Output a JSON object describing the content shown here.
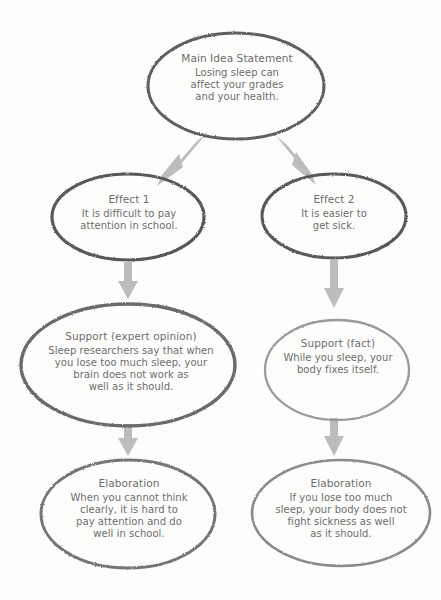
{
  "diagram": {
    "kind": "cause-and-effect-flowchart",
    "background_color": "#fdfdfc",
    "text_color": "#6d6d6d",
    "arrow_color": "#b9b9b9",
    "stroke_color_dark": "#616161",
    "stroke_color_light": "#8e8e8e",
    "nodes": {
      "main_idea": {
        "heading": "Main Idea Statement",
        "body_lines": [
          "Losing sleep can",
          "affect your grades",
          "and your health."
        ],
        "body_text": "Losing sleep can affect your grades and your health."
      },
      "effect_1": {
        "heading": "Effect 1",
        "body_lines": [
          "It is difficult to pay",
          "attention in school."
        ],
        "body_text": "It is difficult to pay attention in school."
      },
      "effect_2": {
        "heading": "Effect 2",
        "body_lines": [
          "It is easier to",
          "get sick."
        ],
        "body_text": "It is easier to get sick."
      },
      "support_1": {
        "heading": "Support (expert opinion)",
        "body_lines": [
          "Sleep researchers say that when",
          "you lose too much sleep, your",
          "brain does not work as",
          "well as it should."
        ],
        "body_text": "Sleep researchers say that when you lose too much sleep, your brain does not work as well as it should."
      },
      "support_2": {
        "heading": "Support (fact)",
        "body_lines": [
          "While you sleep, your",
          "body fixes itself."
        ],
        "body_text": "While you sleep, your body fixes itself."
      },
      "elaboration_1": {
        "heading": "Elaboration",
        "body_lines": [
          "When you cannot think",
          "clearly, it is hard to",
          "pay attention and do",
          "well in school."
        ],
        "body_text": "When you cannot think clearly, it is hard to pay attention and do well in school."
      },
      "elaboration_2": {
        "heading": "Elaboration",
        "body_lines": [
          "If you lose too much",
          "sleep, your body does not",
          "fight sickness as well",
          "as it should."
        ],
        "body_text": "If you lose too much sleep, your body does not fight sickness as well as it should."
      }
    },
    "connectors": [
      {
        "name": "main-idea-to-effect-1",
        "from": "main_idea",
        "to": "effect_1",
        "direction": "down-left"
      },
      {
        "name": "main-idea-to-effect-2",
        "from": "main_idea",
        "to": "effect_2",
        "direction": "down-right"
      },
      {
        "name": "effect-1-to-support-1",
        "from": "effect_1",
        "to": "support_1",
        "direction": "down"
      },
      {
        "name": "effect-2-to-support-2",
        "from": "effect_2",
        "to": "support_2",
        "direction": "down"
      },
      {
        "name": "support-1-to-elaboration-1",
        "from": "support_1",
        "to": "elaboration_1",
        "direction": "down"
      },
      {
        "name": "support-2-to-elaboration-2",
        "from": "support_2",
        "to": "elaboration_2",
        "direction": "down"
      }
    ]
  }
}
